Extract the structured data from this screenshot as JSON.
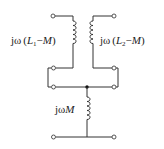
{
  "diagram": {
    "type": "T-equivalent circuit of coupled inductors",
    "labels": {
      "left_inductor": {
        "prefix": "jω",
        "open": "(",
        "var": "L",
        "sub": "1",
        "minus": "−",
        "m": "M",
        "close": ")"
      },
      "right_inductor": {
        "prefix": "jω",
        "open": "(",
        "var": "L",
        "sub": "2",
        "minus": "−",
        "m": "M",
        "close": ")"
      },
      "bottom_inductor": {
        "prefix": "jω",
        "m": "M"
      }
    },
    "components": [
      {
        "id": "left-inductor",
        "value": "jω(L1−M)"
      },
      {
        "id": "right-inductor",
        "value": "jω(L2−M)"
      },
      {
        "id": "shunt-inductor",
        "value": "jωM"
      }
    ],
    "terminals": 8,
    "colors": {
      "line": "#333333",
      "background": "#ffffff"
    }
  }
}
